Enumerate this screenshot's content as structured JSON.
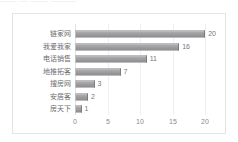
{
  "top_strip": {
    "fragments": [
      "——  —  ——  ———"
    ]
  },
  "colors": {
    "bar_fill": "#9d9d9f",
    "bar_edge": "#bdbdbf",
    "gridline": "#efefef",
    "card_border": "#e4e4e6",
    "label_text": "#6d6d70",
    "tick_text": "#8a8a8d",
    "background": "#ffffff"
  },
  "chart_data": {
    "type": "bar",
    "orientation": "horizontal",
    "title": "",
    "xlabel": "",
    "ylabel": "",
    "categories": [
      "链家网",
      "我爱我家",
      "电话销售",
      "地推拓客",
      "搜房网",
      "安居客",
      "房天下"
    ],
    "values": [
      20,
      16,
      11,
      7,
      3,
      2,
      1
    ],
    "data_labels": [
      "20",
      "16",
      "11",
      "7",
      "3",
      "2",
      "1"
    ],
    "xlim": [
      0,
      21.5
    ],
    "xticks": [
      0,
      5,
      10,
      15,
      20
    ],
    "xtick_labels": [
      "0",
      "5",
      "10",
      "15",
      "20"
    ],
    "grid": "vertical",
    "legend": "none",
    "series": [
      {
        "name": "",
        "values": [
          20,
          16,
          11,
          7,
          3,
          2,
          1
        ]
      }
    ]
  },
  "geometry": {
    "plot_left": 62,
    "plot_right": 202,
    "units_per_px": 0.142857,
    "row_top_start": 14,
    "row_step": 12.5
  }
}
